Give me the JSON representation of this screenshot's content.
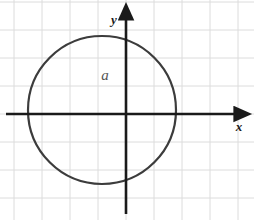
{
  "figure": {
    "width": 254,
    "height": 220,
    "background_color": "#ffffff"
  },
  "grid": {
    "color": "#dcdcdc",
    "line_width": 1,
    "cell_size": 28,
    "x_lines": [
      14,
      42,
      70,
      98,
      126,
      154,
      182,
      210,
      238
    ],
    "y_lines": [
      2,
      30,
      58,
      86,
      114,
      142,
      170,
      198
    ],
    "visible": true
  },
  "axes": {
    "color": "#1a1a1a",
    "line_width": 2.6,
    "origin": {
      "x": 126,
      "y": 114
    },
    "x_axis": {
      "label": "x",
      "start_x": 6,
      "end_x": 236,
      "arrow": "right"
    },
    "y_axis": {
      "label": "y",
      "start_y": 214,
      "end_y": 18,
      "arrow": "up"
    }
  },
  "shapes": {
    "circle": {
      "name": "circle",
      "center_x": 102,
      "center_y": 110,
      "radius": 74,
      "stroke_color": "#3c3c3c",
      "stroke_width": 2.2,
      "fill": "none"
    }
  },
  "labels": {
    "region": {
      "text": "a",
      "x": 105,
      "y": 80,
      "color": "#555555"
    },
    "x_axis_label": {
      "text": "x",
      "x": 239,
      "y": 131
    },
    "y_axis_label": {
      "text": "y",
      "x": 114,
      "y": 24
    }
  }
}
